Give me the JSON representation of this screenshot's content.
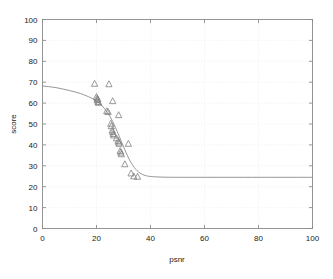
{
  "chart_data": {
    "type": "scatter",
    "title": "",
    "subtitle": "",
    "xlabel": "psnr",
    "ylabel": "score",
    "xlim": [
      0,
      100
    ],
    "ylim": [
      0,
      100
    ],
    "xticks": [
      0,
      20,
      40,
      60,
      80,
      100
    ],
    "yticks": [
      0,
      10,
      20,
      30,
      40,
      50,
      60,
      70,
      80,
      90,
      100
    ],
    "xticklabels": [
      "0",
      "20",
      "40",
      "60",
      "80",
      "100"
    ],
    "yticklabels": [
      "0",
      "10",
      "20",
      "30",
      "40",
      "50",
      "60",
      "70",
      "80",
      "90",
      "100"
    ],
    "grid": true,
    "grid_style": "dotted",
    "legend": null,
    "legend_position": "none",
    "marker": "triangle-up-open",
    "marker_color": "#808080",
    "line_color": "#8a8a8a",
    "axis_color": "#8a8a8a",
    "grid_color": "#e8e8e8",
    "series": [
      {
        "name": "observations",
        "type": "scatter",
        "points": [
          [
            19.3,
            69.3
          ],
          [
            24.6,
            69.1
          ],
          [
            20.0,
            63.0
          ],
          [
            20.2,
            62.2
          ],
          [
            20.3,
            61.4
          ],
          [
            20.5,
            61.8
          ],
          [
            20.6,
            60.6
          ],
          [
            20.8,
            60.2
          ],
          [
            26.0,
            61.0
          ],
          [
            23.8,
            56.2
          ],
          [
            24.3,
            55.8
          ],
          [
            28.2,
            54.3
          ],
          [
            25.3,
            50.2
          ],
          [
            25.5,
            49.0
          ],
          [
            25.8,
            47.0
          ],
          [
            26.0,
            46.2
          ],
          [
            26.2,
            45.3
          ],
          [
            26.4,
            44.6
          ],
          [
            27.4,
            43.2
          ],
          [
            28.0,
            42.0
          ],
          [
            28.2,
            41.2
          ],
          [
            28.4,
            40.6
          ],
          [
            31.8,
            40.6
          ],
          [
            28.8,
            37.2
          ],
          [
            29.0,
            36.4
          ],
          [
            29.2,
            35.6
          ],
          [
            30.5,
            30.8
          ],
          [
            32.8,
            26.4
          ],
          [
            33.8,
            25.0
          ],
          [
            35.2,
            24.8
          ]
        ]
      },
      {
        "name": "fitted-curve",
        "type": "line",
        "description": "sigmoid fit",
        "curve_points": [
          [
            0,
            68.2
          ],
          [
            5,
            67.4
          ],
          [
            10,
            66.0
          ],
          [
            14,
            64.6
          ],
          [
            18,
            62.5
          ],
          [
            20,
            61.0
          ],
          [
            22,
            58.8
          ],
          [
            24,
            55.6
          ],
          [
            26,
            51.2
          ],
          [
            28,
            45.4
          ],
          [
            30,
            39.2
          ],
          [
            32,
            33.4
          ],
          [
            34,
            29.2
          ],
          [
            36,
            26.6
          ],
          [
            38,
            25.4
          ],
          [
            40,
            24.9
          ],
          [
            44,
            24.6
          ],
          [
            50,
            24.5
          ],
          [
            60,
            24.5
          ],
          [
            80,
            24.5
          ],
          [
            100,
            24.5
          ]
        ]
      }
    ]
  }
}
